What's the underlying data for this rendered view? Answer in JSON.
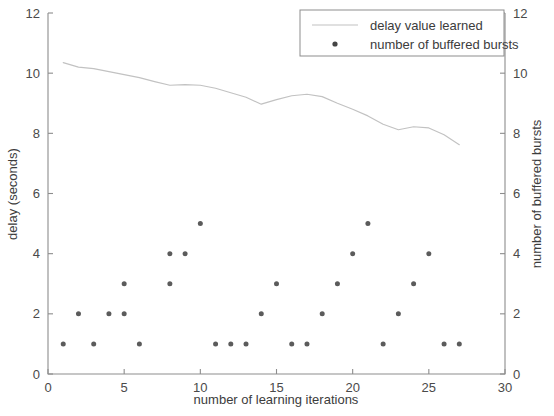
{
  "chart_data": {
    "type": "scatter",
    "title": "",
    "xlabel": "number of learning iterations",
    "ylabel": "delay (seconds)",
    "ylabel_right": "number of buffered bursts",
    "xlim": [
      0,
      30
    ],
    "ylim": [
      0,
      12
    ],
    "ylim_right": [
      0,
      12
    ],
    "xticks": [
      0,
      5,
      10,
      15,
      20,
      25,
      30
    ],
    "yticks": [
      0,
      2,
      4,
      6,
      8,
      10,
      12
    ],
    "yticks_right": [
      0,
      2,
      4,
      6,
      8,
      10,
      12
    ],
    "xticklabels": [
      "0",
      "5",
      "10",
      "15",
      "20",
      "25",
      "30"
    ],
    "yticklabels": [
      "0",
      "2",
      "4",
      "6",
      "8",
      "10",
      "12"
    ],
    "yticklabels_right": [
      "0",
      "2",
      "4",
      "6",
      "8",
      "10",
      "12"
    ],
    "grid": false,
    "legend_position": "top-right",
    "series": [
      {
        "name": "delay value learned",
        "type": "line",
        "axis": "left",
        "color": "#c2c2c2",
        "x": [
          1,
          2,
          3,
          4,
          5,
          6,
          7,
          8,
          9,
          10,
          11,
          12,
          13,
          14,
          15,
          16,
          17,
          18,
          19,
          20,
          21,
          22,
          23,
          24,
          25,
          26,
          27
        ],
        "y": [
          10.35,
          10.2,
          10.15,
          10.05,
          9.95,
          9.85,
          9.72,
          9.6,
          9.62,
          9.6,
          9.5,
          9.35,
          9.2,
          8.97,
          9.12,
          9.25,
          9.3,
          9.22,
          9.0,
          8.8,
          8.58,
          8.3,
          8.12,
          8.22,
          8.18,
          7.95,
          7.62
        ]
      },
      {
        "name": "number of buffered bursts",
        "type": "scatter",
        "axis": "right",
        "color": "#5b5b5b",
        "x": [
          1,
          2,
          3,
          4,
          5,
          5,
          6,
          8,
          8,
          9,
          10,
          11,
          12,
          13,
          14,
          15,
          16,
          17,
          18,
          19,
          20,
          21,
          22,
          23,
          24,
          25,
          26,
          27
        ],
        "y": [
          1,
          2,
          1,
          2,
          2,
          3,
          1,
          4,
          3,
          4,
          5,
          1,
          1,
          1,
          2,
          3,
          1,
          1,
          2,
          3,
          4,
          5,
          1,
          2,
          3,
          4,
          1,
          1
        ]
      }
    ],
    "legend": [
      {
        "label": "delay value learned",
        "marker": "line",
        "color": "#c2c2c2"
      },
      {
        "label": "number of buffered bursts",
        "marker": "dot",
        "color": "#444444"
      }
    ]
  },
  "plot_geometry": {
    "left": 48,
    "right": 505,
    "top": 13,
    "bottom": 374
  }
}
